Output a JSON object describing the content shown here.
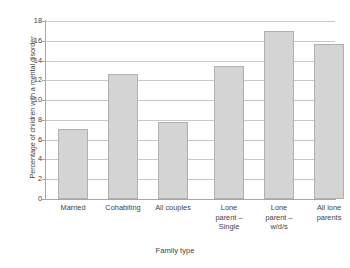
{
  "chart_data": {
    "type": "bar",
    "title": "",
    "xlabel": "Family type",
    "ylabel": "Percentage of children with a mental disorder",
    "categories": [
      "Married",
      "Cohabiting",
      "All couples",
      "Lone parent – Single",
      "Lone parent – w/d/s",
      "All lone parents"
    ],
    "category_lines": [
      [
        "Married"
      ],
      [
        "Cohabiting"
      ],
      [
        "All couples"
      ],
      [
        "Lone",
        "parent –",
        "Single"
      ],
      [
        "Lone",
        "parent –",
        "w/d/s"
      ],
      [
        "All lone",
        "parents"
      ]
    ],
    "values": [
      7.1,
      12.6,
      7.8,
      13.5,
      17.0,
      15.7
    ],
    "ylim": [
      0,
      18
    ],
    "ytick_values": [
      0,
      2,
      4,
      6,
      8,
      10,
      12,
      14,
      16,
      18
    ],
    "ytick_labels": [
      "0",
      "2",
      "4",
      "6",
      "8",
      "10",
      "12",
      "14",
      "16",
      "18"
    ],
    "grid": true,
    "legend": false,
    "groups": [
      {
        "name": "couples",
        "indices": [
          0,
          1,
          2
        ]
      },
      {
        "name": "lone parents",
        "indices": [
          3,
          4,
          5
        ]
      }
    ],
    "colors": {
      "bar_fill": "#d4d4d4",
      "bar_border": "#b0b0b0",
      "gridline": "#c9c9c9",
      "axis": "#a8a8a8",
      "text": "#3f3f3f",
      "background": "#ffffff"
    }
  }
}
